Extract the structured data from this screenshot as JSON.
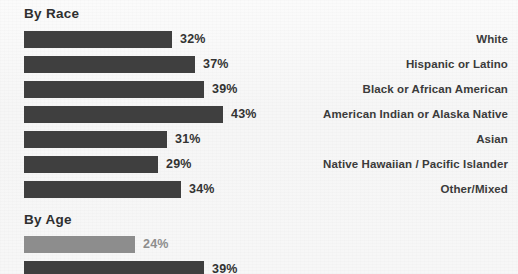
{
  "colors": {
    "bar_dark": "#3f3f3f",
    "bar_light": "#8d8d8d",
    "background": "#f7f7f7",
    "text_dark": "#333333",
    "text_light": "#8d8d8d"
  },
  "sections": {
    "race": {
      "title": "By Race"
    },
    "age": {
      "title": "By Age"
    }
  },
  "chart_data": {
    "type": "bar",
    "title": "By Race",
    "orientation": "horizontal",
    "xlabel": "",
    "ylabel": "",
    "xlim": [
      0,
      100
    ],
    "grid": false,
    "legend": "none",
    "value_suffix": "%",
    "groups": [
      {
        "name": "By Race",
        "categories": [
          "White",
          "Hispanic or Latino",
          "Black or African American",
          "American Indian or Alaska Native",
          "Asian",
          "Native Hawaiian / Pacific Islander",
          "Other/Mixed"
        ],
        "values": [
          32,
          37,
          39,
          43,
          31,
          29,
          34
        ],
        "value_labels": [
          "32%",
          "37%",
          "39%",
          "43%",
          "31%",
          "29%",
          "34%"
        ],
        "bar_styles": [
          "dark",
          "dark",
          "dark",
          "dark",
          "dark",
          "dark",
          "dark"
        ]
      },
      {
        "name": "By Age",
        "categories": [
          "",
          ""
        ],
        "values": [
          24,
          39
        ],
        "value_labels": [
          "24%",
          "39%"
        ],
        "bar_styles": [
          "light",
          "dark"
        ]
      }
    ]
  },
  "rows": {
    "race": [
      {
        "value_label": "32%",
        "value": 32,
        "category": "White",
        "style": "dark"
      },
      {
        "value_label": "37%",
        "value": 37,
        "category": "Hispanic or Latino",
        "style": "dark"
      },
      {
        "value_label": "39%",
        "value": 39,
        "category": "Black or African American",
        "style": "dark"
      },
      {
        "value_label": "43%",
        "value": 43,
        "category": "American Indian or Alaska Native",
        "style": "dark"
      },
      {
        "value_label": "31%",
        "value": 31,
        "category": "Asian",
        "style": "dark"
      },
      {
        "value_label": "29%",
        "value": 29,
        "category": "Native Hawaiian / Pacific Islander",
        "style": "dark"
      },
      {
        "value_label": "34%",
        "value": 34,
        "category": "Other/Mixed",
        "style": "dark"
      }
    ],
    "age": [
      {
        "value_label": "24%",
        "value": 24,
        "category": "",
        "style": "light"
      },
      {
        "value_label": "39%",
        "value": 39,
        "category": "",
        "style": "dark"
      }
    ]
  }
}
